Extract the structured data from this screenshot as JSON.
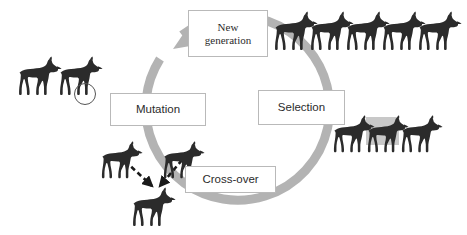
{
  "diagram": {
    "background_color": "#ffffff",
    "ring": {
      "icon": "circular-arrow-icon",
      "color": "#b3b3b3",
      "center_x": 230,
      "center_y": 118,
      "radius": 92,
      "stroke_width": 9,
      "direction": "clockwise",
      "arrowhead_at": "top-left"
    },
    "stages": [
      {
        "id": "new-generation",
        "label": "New\ngeneration",
        "line1": "New",
        "line2": "generation",
        "font": "serif"
      },
      {
        "id": "mutation",
        "label": "Mutation",
        "font": "sans"
      },
      {
        "id": "selection",
        "label": "Selection",
        "font": "sans"
      },
      {
        "id": "crossover",
        "label": "Cross-over",
        "font": "sans"
      }
    ],
    "groups": {
      "mutation_population": {
        "icon": "wolf-icon",
        "count": 2,
        "color": "#2b2b2b",
        "highlight": {
          "icon": "circle-highlight-icon",
          "shape": "circle",
          "target": "legs-of-second-wolf",
          "stroke_color": "#555555"
        }
      },
      "new_generation_population": {
        "icon": "wolf-icon",
        "count": 5,
        "color": "#2b2b2b"
      },
      "selection_population": {
        "icon": "wolf-icon",
        "count": 3,
        "color": "#2b2b2b",
        "highlight": {
          "icon": "rectangle-highlight-icon",
          "shape": "rectangle",
          "target": "middle-wolf",
          "fill_color": "#c8c8c8"
        }
      },
      "crossover_parents": {
        "icon": "wolf-icon",
        "count": 2,
        "color": "#2b2b2b"
      },
      "crossover_offspring": {
        "icon": "wolf-icon",
        "count": 1,
        "color": "#2b2b2b"
      }
    },
    "arrows": {
      "crossover": {
        "icon": "dashed-arrow-icon",
        "count": 2,
        "style": "dashed",
        "color": "#1a1a1a",
        "direction": "converging-down"
      }
    }
  }
}
